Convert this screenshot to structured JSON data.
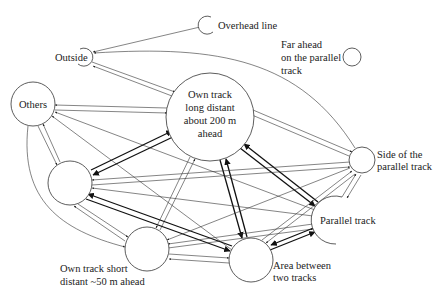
{
  "diagram": {
    "type": "state-transition graph",
    "nodes": [
      {
        "id": "overhead",
        "label": "Overhead line",
        "cx": 208,
        "cy": 25,
        "r": 9
      },
      {
        "id": "outside",
        "label": "Outside",
        "cx": 85,
        "cy": 57,
        "r": 9
      },
      {
        "id": "others",
        "label": "Others",
        "cx": 33,
        "cy": 104,
        "r": 22
      },
      {
        "id": "ownlong",
        "label_lines": [
          "Own track",
          "long distant",
          "about 200 m",
          "ahead"
        ],
        "cx": 210,
        "cy": 117,
        "r": 44
      },
      {
        "id": "unlabeled",
        "label": "",
        "cx": 70,
        "cy": 183,
        "r": 22
      },
      {
        "id": "farahead",
        "label_lines": [
          "Far ahead",
          "on the parallel",
          "track"
        ],
        "cx": 352,
        "cy": 57,
        "r": 9
      },
      {
        "id": "side",
        "label_lines": [
          "Side of the",
          "parallel track"
        ],
        "cx": 362,
        "cy": 160,
        "r": 13
      },
      {
        "id": "parallel",
        "label": "Parallel track",
        "cx": 337,
        "cy": 220,
        "r": 24
      },
      {
        "id": "ownshort",
        "label_lines": [
          "Own track short",
          "distant ~50 m ahead"
        ],
        "cx": 147,
        "cy": 249,
        "r": 22
      },
      {
        "id": "between",
        "label_lines": [
          "Area between",
          "two tracks"
        ],
        "cx": 251,
        "cy": 260,
        "r": 22
      }
    ],
    "labels": {
      "overhead": "Overhead line",
      "outside": "Outside",
      "others": "Others",
      "ownlong": [
        "Own track",
        "long distant",
        "about 200 m",
        "ahead"
      ],
      "farahead": [
        "Far ahead",
        "on the parallel",
        "track"
      ],
      "side": [
        "Side of the",
        "parallel track"
      ],
      "parallel": "Parallel track",
      "ownshort": [
        "Own track short",
        "distant ~50 m ahead"
      ],
      "between": [
        "Area between",
        "two tracks"
      ]
    }
  }
}
